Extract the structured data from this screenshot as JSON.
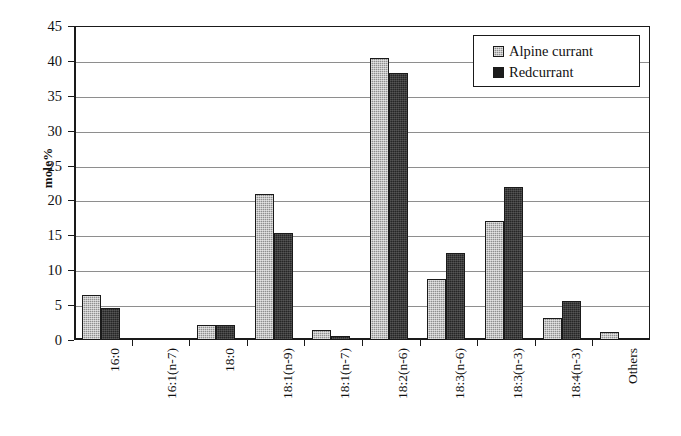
{
  "chart_data": {
    "type": "bar",
    "title": "",
    "xlabel": "",
    "ylabel": "mole%",
    "ylim": [
      0,
      45
    ],
    "yticks": [
      0,
      5,
      10,
      15,
      20,
      25,
      30,
      35,
      40,
      45
    ],
    "grid": true,
    "legend_position": "top-right",
    "categories": [
      "16:0",
      "16:1(n-7)",
      "18:0",
      "18:1(n-9)",
      "18:1(n-7)",
      "18:2(n-6)",
      "18:3(n-6)",
      "18:3(n-3)",
      "18:4(n-3)",
      "Others"
    ],
    "series": [
      {
        "name": "Alpine currant",
        "color": "#8f8f8f",
        "values": [
          6.5,
          0.2,
          2.1,
          20.9,
          1.4,
          40.4,
          8.8,
          17.0,
          3.2,
          1.1
        ]
      },
      {
        "name": "Redcurrant",
        "color": "#262626",
        "values": [
          4.6,
          0.2,
          2.1,
          15.4,
          0.6,
          38.2,
          12.4,
          21.9,
          5.6,
          0.1
        ]
      }
    ]
  },
  "axis": {
    "y_title": "mole%"
  },
  "legend": {
    "items": [
      {
        "label": "Alpine currant",
        "swatch": "alpine"
      },
      {
        "label": "Redcurrant",
        "swatch": "red"
      }
    ]
  }
}
